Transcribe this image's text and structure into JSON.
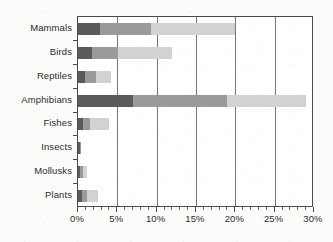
{
  "chart_data": {
    "type": "bar",
    "orientation": "horizontal",
    "stacked": true,
    "title": "",
    "subtitle": "",
    "xlabel": "",
    "ylabel": "",
    "xlim": [
      0,
      30
    ],
    "ylim": null,
    "grid": true,
    "legend": null,
    "legend_position": "none",
    "x_unit": "%",
    "x_ticks": [
      0,
      5,
      10,
      15,
      20,
      25,
      30
    ],
    "x_tick_labels": [
      "0%",
      "5%",
      "10%",
      "15%",
      "20%",
      "25%",
      "30%"
    ],
    "x_minor_tick_interval": 1,
    "categories": [
      "Mammals",
      "Birds",
      "Reptiles",
      "Amphibians",
      "Fishes",
      "Insects",
      "Mollusks",
      "Plants"
    ],
    "series": [
      {
        "name": "dark",
        "color": "#5a5a5a",
        "values": [
          2.8,
          1.8,
          0.9,
          7.0,
          0.6,
          0.25,
          0.25,
          0.5
        ]
      },
      {
        "name": "medium",
        "color": "#9a9a9a",
        "values": [
          6.5,
          3.3,
          1.4,
          12.0,
          0.9,
          0.1,
          0.35,
          0.6
        ]
      },
      {
        "name": "light",
        "color": "#d2d2d2",
        "values": [
          10.7,
          6.9,
          1.9,
          10.0,
          2.5,
          0.0,
          0.5,
          1.4
        ]
      }
    ],
    "totals": [
      20.0,
      12.0,
      4.2,
      29.0,
      4.0,
      0.35,
      1.1,
      2.5
    ]
  },
  "axis": {
    "y_tick_labels": [
      "Mammals",
      "Birds",
      "Reptiles",
      "Amphibians",
      "Fishes",
      "Insects",
      "Mollusks",
      "Plants"
    ],
    "x_tick_labels": [
      "0%",
      "5%",
      "10%",
      "15%",
      "20%",
      "25%",
      "30%"
    ]
  },
  "colors": {
    "segment_dark": "#5a5a5a",
    "segment_medium": "#9a9a9a",
    "segment_light": "#d2d2d2",
    "axis": "#4a4a4a",
    "gridline": "#777777",
    "background": "#fbfbfa",
    "plot_background": "#ffffff",
    "text": "#2b2b2b"
  }
}
